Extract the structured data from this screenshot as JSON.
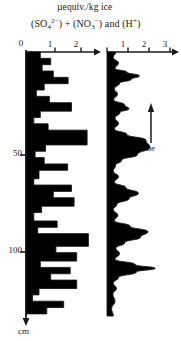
{
  "figure": {
    "title_units": "µequiv./kg ice",
    "title_species": "(SO₄²⁻) + (NO₃⁻) and (H⁺)",
    "title_species_parts": {
      "p1": "(SO",
      "sub1": "4",
      "sup1": "2−",
      "p2": ") + (NO",
      "sub2": "3",
      "sup2": "−",
      "p3": ") and  (H",
      "sup3": "+",
      "p4": ")"
    },
    "depth_axis": {
      "label": "cm",
      "zero_label": "0",
      "ticks": [
        {
          "value": 50,
          "label": "50"
        },
        {
          "value": 100,
          "label": "100"
        }
      ],
      "range": [
        0,
        125
      ]
    },
    "time_arrow": {
      "label": "time",
      "direction": "up"
    },
    "left_panel": {
      "name": "sulfate-nitrate-profile",
      "x_ticks": [
        {
          "value": 0,
          "label": "0"
        },
        {
          "value": 1,
          "label": "1"
        },
        {
          "value": 2,
          "label": "2"
        }
      ],
      "xlim": [
        0,
        2.6
      ],
      "fill_color": "#000000",
      "line_color": "#1a1a1a"
    },
    "right_panel": {
      "name": "acidity-profile",
      "x_ticks": [
        {
          "value": 1,
          "label": "1"
        },
        {
          "value": 2,
          "label": "2"
        },
        {
          "value": 3,
          "label": "3"
        }
      ],
      "xlim": [
        0,
        3.4
      ],
      "fill_color": "#000000",
      "line_color": "#1a1a1a"
    }
  },
  "chart_data": {
    "type": "line",
    "title": "µequiv./kg ice",
    "subtitle": "(SO4 2-) + (NO3-) and (H+)",
    "xlabel": "µequiv./kg ice",
    "ylabel": "cm",
    "ylim": [
      0,
      125
    ],
    "y_inverted": true,
    "grid": false,
    "legend": "none",
    "annotations": [
      "time"
    ],
    "series": [
      {
        "name": "(SO4 2-) + (NO3-)",
        "panel": "left",
        "style": "step-histogram",
        "xlim": [
          0,
          2.6
        ],
        "x_ticks": [
          0,
          1,
          2
        ],
        "points": [
          {
            "depth": 0,
            "value": 0.55
          },
          {
            "depth": 3,
            "value": 0.55
          },
          {
            "depth": 3,
            "value": 0.95
          },
          {
            "depth": 6,
            "value": 0.95
          },
          {
            "depth": 6,
            "value": 0.62
          },
          {
            "depth": 9,
            "value": 0.62
          },
          {
            "depth": 9,
            "value": 1.05
          },
          {
            "depth": 12,
            "value": 1.05
          },
          {
            "depth": 12,
            "value": 1.62
          },
          {
            "depth": 15,
            "value": 1.62
          },
          {
            "depth": 15,
            "value": 0.7
          },
          {
            "depth": 18,
            "value": 0.7
          },
          {
            "depth": 18,
            "value": 0.4
          },
          {
            "depth": 21,
            "value": 0.4
          },
          {
            "depth": 21,
            "value": 0.9
          },
          {
            "depth": 24,
            "value": 0.9
          },
          {
            "depth": 24,
            "value": 1.75
          },
          {
            "depth": 28,
            "value": 1.75
          },
          {
            "depth": 28,
            "value": 0.55
          },
          {
            "depth": 31,
            "value": 0.55
          },
          {
            "depth": 31,
            "value": 0.3
          },
          {
            "depth": 34,
            "value": 0.3
          },
          {
            "depth": 34,
            "value": 0.85
          },
          {
            "depth": 37,
            "value": 0.85
          },
          {
            "depth": 37,
            "value": 2.35
          },
          {
            "depth": 44,
            "value": 2.35
          },
          {
            "depth": 44,
            "value": 0.75
          },
          {
            "depth": 47,
            "value": 0.75
          },
          {
            "depth": 47,
            "value": 0.35
          },
          {
            "depth": 50,
            "value": 0.35
          },
          {
            "depth": 50,
            "value": 0.7
          },
          {
            "depth": 53,
            "value": 0.7
          },
          {
            "depth": 53,
            "value": 1.6
          },
          {
            "depth": 56,
            "value": 1.6
          },
          {
            "depth": 56,
            "value": 0.5
          },
          {
            "depth": 60,
            "value": 0.5
          },
          {
            "depth": 60,
            "value": 0.3
          },
          {
            "depth": 63,
            "value": 0.3
          },
          {
            "depth": 63,
            "value": 1.75
          },
          {
            "depth": 66,
            "value": 1.75
          },
          {
            "depth": 66,
            "value": 1.05
          },
          {
            "depth": 69,
            "value": 1.05
          },
          {
            "depth": 69,
            "value": 1.85
          },
          {
            "depth": 73,
            "value": 1.85
          },
          {
            "depth": 73,
            "value": 0.6
          },
          {
            "depth": 76,
            "value": 0.6
          },
          {
            "depth": 76,
            "value": 0.3
          },
          {
            "depth": 80,
            "value": 0.3
          },
          {
            "depth": 80,
            "value": 1.2
          },
          {
            "depth": 83,
            "value": 1.2
          },
          {
            "depth": 83,
            "value": 0.45
          },
          {
            "depth": 86,
            "value": 0.45
          },
          {
            "depth": 86,
            "value": 2.4
          },
          {
            "depth": 92,
            "value": 2.4
          },
          {
            "depth": 92,
            "value": 1.15
          },
          {
            "depth": 95,
            "value": 1.15
          },
          {
            "depth": 95,
            "value": 1.95
          },
          {
            "depth": 99,
            "value": 1.95
          },
          {
            "depth": 99,
            "value": 0.55
          },
          {
            "depth": 102,
            "value": 0.55
          },
          {
            "depth": 102,
            "value": 1.7
          },
          {
            "depth": 105,
            "value": 1.7
          },
          {
            "depth": 105,
            "value": 0.95
          },
          {
            "depth": 108,
            "value": 0.95
          },
          {
            "depth": 108,
            "value": 1.95
          },
          {
            "depth": 112,
            "value": 1.95
          },
          {
            "depth": 112,
            "value": 0.5
          },
          {
            "depth": 115,
            "value": 0.5
          },
          {
            "depth": 115,
            "value": 0.25
          },
          {
            "depth": 118,
            "value": 0.25
          },
          {
            "depth": 118,
            "value": 1.45
          },
          {
            "depth": 121,
            "value": 1.45
          },
          {
            "depth": 121,
            "value": 0.8
          },
          {
            "depth": 124,
            "value": 0.8
          }
        ]
      },
      {
        "name": "(H+)",
        "panel": "right",
        "style": "smooth-filled-peaks",
        "xlim": [
          0,
          3.4
        ],
        "x_ticks": [
          1,
          2,
          3
        ],
        "points": [
          {
            "depth": 0,
            "value": 0.42
          },
          {
            "depth": 3,
            "value": 0.3
          },
          {
            "depth": 6,
            "value": 0.55
          },
          {
            "depth": 9,
            "value": 0.38
          },
          {
            "depth": 11,
            "value": 0.95
          },
          {
            "depth": 13,
            "value": 1.55
          },
          {
            "depth": 15,
            "value": 1.15
          },
          {
            "depth": 17,
            "value": 0.6
          },
          {
            "depth": 20,
            "value": 0.35
          },
          {
            "depth": 23,
            "value": 0.5
          },
          {
            "depth": 26,
            "value": 0.32
          },
          {
            "depth": 29,
            "value": 0.85
          },
          {
            "depth": 31,
            "value": 1.05
          },
          {
            "depth": 33,
            "value": 0.62
          },
          {
            "depth": 36,
            "value": 0.38
          },
          {
            "depth": 39,
            "value": 0.55
          },
          {
            "depth": 42,
            "value": 0.35
          },
          {
            "depth": 45,
            "value": 0.95
          },
          {
            "depth": 48,
            "value": 1.85
          },
          {
            "depth": 52,
            "value": 2.05
          },
          {
            "depth": 56,
            "value": 1.45
          },
          {
            "depth": 59,
            "value": 0.7
          },
          {
            "depth": 62,
            "value": 0.4
          },
          {
            "depth": 65,
            "value": 0.3
          },
          {
            "depth": 68,
            "value": 0.55
          },
          {
            "depth": 71,
            "value": 0.35
          },
          {
            "depth": 74,
            "value": 0.9
          },
          {
            "depth": 77,
            "value": 1.5
          },
          {
            "depth": 80,
            "value": 1.05
          },
          {
            "depth": 83,
            "value": 0.48
          },
          {
            "depth": 86,
            "value": 0.3
          },
          {
            "depth": 89,
            "value": 0.52
          },
          {
            "depth": 92,
            "value": 0.35
          },
          {
            "depth": 95,
            "value": 1.1
          },
          {
            "depth": 98,
            "value": 1.95
          },
          {
            "depth": 101,
            "value": 1.6
          },
          {
            "depth": 104,
            "value": 0.85
          },
          {
            "depth": 107,
            "value": 0.42
          },
          {
            "depth": 110,
            "value": 0.6
          },
          {
            "depth": 113,
            "value": 0.38
          },
          {
            "depth": 116,
            "value": 1.35
          },
          {
            "depth": 118,
            "value": 2.3
          },
          {
            "depth": 120,
            "value": 1.4
          },
          {
            "depth": 123,
            "value": 0.55
          },
          {
            "depth": 126,
            "value": 0.3
          },
          {
            "depth": 129,
            "value": 0.45
          },
          {
            "depth": 132,
            "value": 0.28
          },
          {
            "depth": 136,
            "value": 0.38
          },
          {
            "depth": 140,
            "value": 0.22
          },
          {
            "depth": 144,
            "value": 0.3
          }
        ]
      }
    ]
  }
}
